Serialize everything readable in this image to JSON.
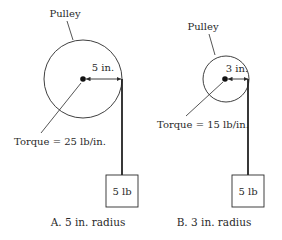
{
  "panels": [
    {
      "id": "A",
      "pulley_label": "Pulley",
      "radius_label": "5 in.",
      "torque_label": "Torque = 25 lb/in.",
      "weight_label": "5 lb",
      "caption": "A.  5 in. radius",
      "geometry": {
        "cx": 83,
        "cy": 79,
        "r": 39
      }
    },
    {
      "id": "B",
      "pulley_label": "Pulley",
      "radius_label": "3 in.",
      "torque_label": "Torque = 15 lb/in.",
      "weight_label": "5 lb",
      "caption": "B.  3 in. radius",
      "geometry": {
        "cx": 226,
        "cy": 79,
        "r": 23
      }
    }
  ],
  "colors": {
    "ink": "#2a2a2a",
    "background": "#ffffff"
  }
}
